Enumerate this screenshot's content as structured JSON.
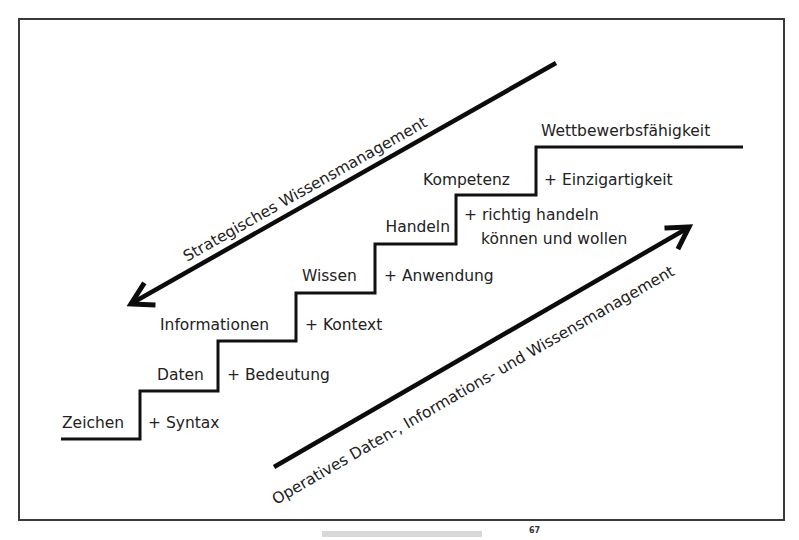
{
  "diagram": {
    "steps": [
      {
        "level": "Zeichen",
        "addition": "+ Syntax"
      },
      {
        "level": "Daten",
        "addition": "+ Bedeutung"
      },
      {
        "level": "Informationen",
        "addition": "+ Kontext"
      },
      {
        "level": "Wissen",
        "addition": "+ Anwendung"
      },
      {
        "level": "Handeln",
        "addition": "+ richtig handeln",
        "addition_line2": "können und wollen"
      },
      {
        "level": "Kompetenz",
        "addition": "+ Einzigartigkeit"
      },
      {
        "level": "Wettbewerbsfähigkeit"
      }
    ],
    "arrows": {
      "strategic": {
        "label": "Strategisches Wissensmanagement",
        "direction": "down-left"
      },
      "operative": {
        "label": "Operatives Daten-, Informations- und Wissensmanagement",
        "direction": "up-right"
      }
    },
    "colors": {
      "line": "#111111",
      "text": "#222222",
      "frame": "#3a3a3a",
      "background": "#ffffff"
    }
  },
  "caption": {
    "text": "",
    "footnote_marker": "67"
  }
}
